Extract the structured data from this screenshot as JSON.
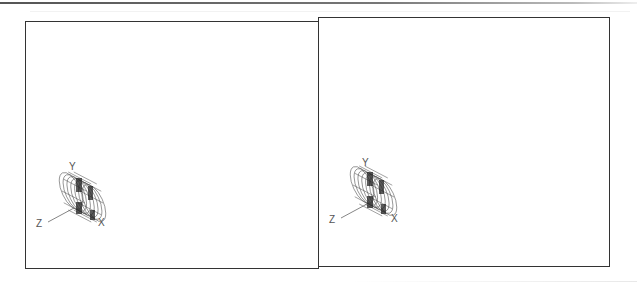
{
  "viewports": [
    {
      "id": "left",
      "ucs": {
        "x_label": "X",
        "y_label": "Y",
        "z_label": "Z"
      },
      "model": "cylindrical-wireframe-assembly"
    },
    {
      "id": "right",
      "ucs": {
        "x_label": "X",
        "y_label": "Y",
        "z_label": "Z"
      },
      "model": "cylindrical-wireframe-assembly"
    }
  ],
  "colors": {
    "frame": "#333333",
    "wire": "#444444",
    "background": "#ffffff"
  }
}
